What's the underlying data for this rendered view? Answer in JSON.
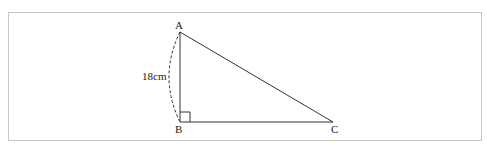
{
  "diagram": {
    "type": "right-triangle",
    "points": {
      "A": {
        "label": "A"
      },
      "B": {
        "label": "B"
      },
      "C": {
        "label": "C"
      }
    },
    "right_angle_at": "B",
    "side_AB_length": "18cm",
    "colors": {
      "stroke": "#333333",
      "border": "#c8c8c8"
    }
  }
}
